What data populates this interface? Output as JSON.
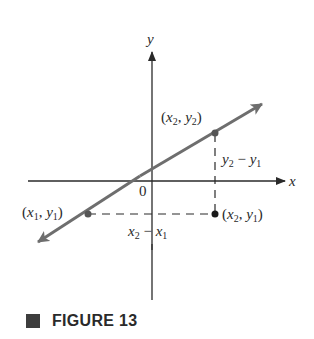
{
  "figure": {
    "caption_label": "FIGURE 13"
  },
  "axes": {
    "x_label": "x",
    "y_label": "y",
    "origin_label": "0"
  },
  "points": {
    "p1": {
      "x": "x",
      "x_sub": "1",
      "y": "y",
      "y_sub": "1"
    },
    "p2": {
      "x": "x",
      "x_sub": "2",
      "y": "y",
      "y_sub": "2"
    },
    "corner": {
      "x": "x",
      "x_sub": "2",
      "y": "y",
      "y_sub": "1"
    }
  },
  "differences": {
    "rise": {
      "a": "y",
      "a_sub": "2",
      "op": " − ",
      "b": "y",
      "b_sub": "1"
    },
    "run": {
      "a": "x",
      "a_sub": "2",
      "op": " − ",
      "b": "x",
      "b_sub": "1"
    }
  },
  "colors": {
    "line": "#6e6e6e",
    "axis": "#2a2a2a",
    "text": "#2a2a2a"
  }
}
